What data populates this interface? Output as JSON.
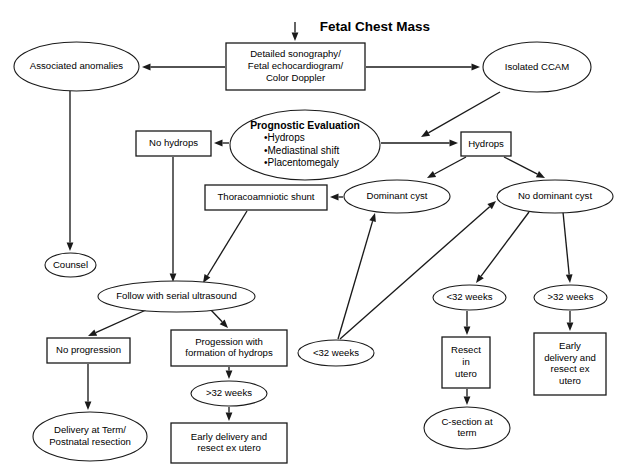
{
  "diagram": {
    "title": "Fetal Chest Mass",
    "type": "flowchart",
    "width": 621,
    "height": 476,
    "background_color": "#ffffff",
    "line_color": "#1a1a1a",
    "text_color": "#000000",
    "nodes": [
      {
        "id": "fetal-chest-mass",
        "label": "Fetal Chest Mass",
        "shape": "title",
        "x": 295,
        "y": 16,
        "w": 160,
        "h": 18,
        "bold": true
      },
      {
        "id": "detailed-sonography",
        "label": "Detailed sonography/ Fetal echocardiogram/ Color Doppler",
        "lines": [
          "Detailed sonography/",
          "Fetal echocardiogram/",
          "Color Doppler"
        ],
        "shape": "rect",
        "x": 226,
        "y": 43,
        "w": 139,
        "h": 47
      },
      {
        "id": "associated-anomalies",
        "label": "Associated anomalies",
        "lines": [
          "Associated anomalies"
        ],
        "shape": "ellipse",
        "x": 14,
        "y": 42,
        "w": 125,
        "h": 49
      },
      {
        "id": "isolated-ccam",
        "label": "Isolated CCAM",
        "lines": [
          "Isolated CCAM"
        ],
        "shape": "ellipse",
        "x": 483,
        "y": 42,
        "w": 108,
        "h": 50
      },
      {
        "id": "prognostic-evaluation",
        "label": "Prognostic Evaluation",
        "lines": [
          "Prognostic Evaluation",
          "•Hydrops",
          "•Mediastinal shift",
          "•Placentomegaly"
        ],
        "bullets": [
          "•Hydrops",
          "•Mediastinal shift",
          "•Placentomegaly"
        ],
        "heading": "Prognostic Evaluation",
        "shape": "ellipse",
        "x": 230,
        "y": 110,
        "w": 150,
        "h": 70
      },
      {
        "id": "no-hydrops",
        "label": "No hydrops",
        "lines": [
          "No hydrops"
        ],
        "shape": "rect",
        "x": 136,
        "y": 131,
        "w": 75,
        "h": 25
      },
      {
        "id": "hydrops",
        "label": "Hydrops",
        "lines": [
          "Hydrops"
        ],
        "shape": "rect",
        "x": 461,
        "y": 132,
        "w": 50,
        "h": 24
      },
      {
        "id": "thoracoamniotic-shunt",
        "label": "Thoracoamniotic shunt",
        "lines": [
          "Thoracoamniotic shunt"
        ],
        "shape": "rect",
        "x": 205,
        "y": 185,
        "w": 122,
        "h": 25
      },
      {
        "id": "dominant-cyst",
        "label": "Dominant cyst",
        "lines": [
          "Dominant cyst"
        ],
        "shape": "ellipse",
        "x": 344,
        "y": 180,
        "w": 106,
        "h": 33
      },
      {
        "id": "no-dominant-cyst",
        "label": "No dominant cyst",
        "lines": [
          "No dominant cyst"
        ],
        "shape": "ellipse",
        "x": 497,
        "y": 180,
        "w": 116,
        "h": 33
      },
      {
        "id": "counsel",
        "label": "Counsel",
        "lines": [
          "Counsel"
        ],
        "shape": "ellipse",
        "x": 45,
        "y": 253,
        "w": 51,
        "h": 24
      },
      {
        "id": "follow-serial-ultrasound",
        "label": "Follow with serial ultrasound",
        "lines": [
          "Follow with serial ultrasound"
        ],
        "shape": "ellipse",
        "x": 98,
        "y": 281,
        "w": 157,
        "h": 31
      },
      {
        "id": "no-progression",
        "label": "No progression",
        "lines": [
          "No progression"
        ],
        "shape": "rect",
        "x": 47,
        "y": 338,
        "w": 83,
        "h": 25
      },
      {
        "id": "progression-hydrops",
        "label": "Progession with formation of hydrops",
        "lines": [
          "Progession with",
          "formation of hydrops"
        ],
        "shape": "rect",
        "x": 171,
        "y": 330,
        "w": 116,
        "h": 36
      },
      {
        "id": "lt32-weeks-center",
        "label": "<32 weeks",
        "lines": [
          "<32 weeks"
        ],
        "shape": "ellipse",
        "x": 298,
        "y": 340,
        "w": 76,
        "h": 26
      },
      {
        "id": "gt32-weeks-left",
        "label": ">32 weeks",
        "lines": [
          ">32 weeks"
        ],
        "shape": "ellipse",
        "x": 191,
        "y": 381,
        "w": 76,
        "h": 25
      },
      {
        "id": "delivery-term",
        "label": "Delivery at Term/ Postnatal resection",
        "lines": [
          "Delivery at Term/",
          "Postnatal resection"
        ],
        "shape": "ellipse",
        "x": 33,
        "y": 412,
        "w": 114,
        "h": 49
      },
      {
        "id": "early-delivery-resect",
        "label": "Early delivery and resect ex utero",
        "lines": [
          "Early delivery and",
          "resect ex utero"
        ],
        "shape": "rect",
        "x": 171,
        "y": 423,
        "w": 116,
        "h": 40
      },
      {
        "id": "lt32-weeks-right",
        "label": "<32 weeks",
        "lines": [
          "<32 weeks"
        ],
        "shape": "ellipse",
        "x": 433,
        "y": 285,
        "w": 73,
        "h": 25
      },
      {
        "id": "gt32-weeks-right",
        "label": ">32 weeks",
        "lines": [
          ">32 weeks"
        ],
        "shape": "ellipse",
        "x": 534,
        "y": 285,
        "w": 73,
        "h": 25
      },
      {
        "id": "resect-in-utero",
        "label": "Resect in utero",
        "lines": [
          "Resect",
          "in",
          "utero"
        ],
        "shape": "rect",
        "x": 442,
        "y": 337,
        "w": 48,
        "h": 51
      },
      {
        "id": "early-delivery-resect-ex-utero",
        "label": "Early delivery and resect ex utero",
        "lines": [
          "Early",
          "delivery and",
          "resect ex",
          "utero"
        ],
        "shape": "rect",
        "x": 534,
        "y": 333,
        "w": 72,
        "h": 62
      },
      {
        "id": "c-section-term",
        "label": "C-section at term",
        "lines": [
          "C-section at",
          "term"
        ],
        "shape": "ellipse",
        "x": 424,
        "y": 407,
        "w": 86,
        "h": 42
      }
    ],
    "edges": [
      {
        "id": "e-title-sono",
        "from": "fetal-chest-mass",
        "to": "detailed-sonography",
        "points": [
          [
            295,
            22
          ],
          [
            295,
            41
          ]
        ]
      },
      {
        "id": "e-sono-assoc",
        "from": "detailed-sonography",
        "to": "associated-anomalies",
        "points": [
          [
            225,
            67
          ],
          [
            142,
            67
          ]
        ]
      },
      {
        "id": "e-sono-ccam",
        "from": "detailed-sonography",
        "to": "isolated-ccam",
        "points": [
          [
            366,
            67
          ],
          [
            480,
            67
          ]
        ]
      },
      {
        "id": "e-ccam-prog",
        "from": "isolated-ccam",
        "to": "prognostic-evaluation",
        "points": [
          [
            500,
            92
          ],
          [
            421,
            137
          ]
        ]
      },
      {
        "id": "e-assoc-counsel",
        "from": "associated-anomalies",
        "to": "counsel",
        "points": [
          [
            70,
            91
          ],
          [
            70,
            251
          ]
        ]
      },
      {
        "id": "e-prog-nohydrops",
        "from": "prognostic-evaluation",
        "to": "no-hydrops",
        "points": [
          [
            229,
            143
          ],
          [
            214,
            143
          ]
        ]
      },
      {
        "id": "e-prog-hydrops",
        "from": "prognostic-evaluation",
        "to": "hydrops",
        "points": [
          [
            381,
            143
          ],
          [
            458,
            143
          ]
        ]
      },
      {
        "id": "e-nohydrops-follow",
        "from": "no-hydrops",
        "to": "follow-serial-ultrasound",
        "points": [
          [
            173,
            157
          ],
          [
            173,
            282
          ]
        ]
      },
      {
        "id": "e-hydrops-domcyst",
        "from": "hydrops",
        "to": "dominant-cyst",
        "points": [
          [
            466,
            157
          ],
          [
            427,
            178
          ]
        ]
      },
      {
        "id": "e-hydrops-nodomcyst",
        "from": "hydrops",
        "to": "no-dominant-cyst",
        "points": [
          [
            504,
            157
          ],
          [
            545,
            178
          ]
        ]
      },
      {
        "id": "e-domcyst-shunt",
        "from": "dominant-cyst",
        "to": "thoracoamniotic-shunt",
        "points": [
          [
            343,
            197
          ],
          [
            330,
            197
          ]
        ]
      },
      {
        "id": "e-shunt-follow",
        "from": "thoracoamniotic-shunt",
        "to": "follow-serial-ultrasound",
        "points": [
          [
            247,
            211
          ],
          [
            203,
            283
          ]
        ]
      },
      {
        "id": "e-lt32c-domcyst",
        "from": "lt32-weeks-center",
        "to": "dominant-cyst",
        "points": [
          [
            338,
            339
          ],
          [
            375,
            213
          ]
        ]
      },
      {
        "id": "e-lt32c-nodomcyst",
        "from": "lt32-weeks-center",
        "to": "no-dominant-cyst",
        "points": [
          [
            340,
            339
          ],
          [
            496,
            201
          ]
        ]
      },
      {
        "id": "e-nodomcyst-lt32r",
        "from": "no-dominant-cyst",
        "to": "lt32-weeks-right",
        "points": [
          [
            529,
            212
          ],
          [
            476,
            283
          ]
        ]
      },
      {
        "id": "e-nodomcyst-gt32r",
        "from": "no-dominant-cyst",
        "to": "gt32-weeks-right",
        "points": [
          [
            563,
            212
          ],
          [
            570,
            283
          ]
        ]
      },
      {
        "id": "e-lt32r-resect",
        "from": "lt32-weeks-right",
        "to": "resect-in-utero",
        "points": [
          [
            467,
            311
          ],
          [
            467,
            335
          ]
        ]
      },
      {
        "id": "e-gt32r-early",
        "from": "gt32-weeks-right",
        "to": "early-delivery-resect-ex-utero",
        "points": [
          [
            570,
            311
          ],
          [
            570,
            331
          ]
        ]
      },
      {
        "id": "e-resect-csection",
        "from": "resect-in-utero",
        "to": "c-section-term",
        "points": [
          [
            467,
            389
          ],
          [
            467,
            405
          ]
        ]
      },
      {
        "id": "e-follow-noprog",
        "from": "follow-serial-ultrasound",
        "to": "no-progression",
        "points": [
          [
            146,
            310
          ],
          [
            88,
            336
          ]
        ]
      },
      {
        "id": "e-follow-prog",
        "from": "follow-serial-ultrasound",
        "to": "progression-hydrops",
        "points": [
          [
            210,
            309
          ],
          [
            228,
            328
          ]
        ]
      },
      {
        "id": "e-noprog-delivery",
        "from": "no-progression",
        "to": "delivery-term",
        "points": [
          [
            88,
            364
          ],
          [
            88,
            410
          ]
        ]
      },
      {
        "id": "e-prog-gt32l",
        "from": "progression-hydrops",
        "to": "gt32-weeks-left",
        "points": [
          [
            229,
            367
          ],
          [
            229,
            379
          ]
        ]
      },
      {
        "id": "e-gt32l-early",
        "from": "gt32-weeks-left",
        "to": "early-delivery-resect",
        "points": [
          [
            229,
            407
          ],
          [
            229,
            421
          ]
        ]
      }
    ]
  }
}
